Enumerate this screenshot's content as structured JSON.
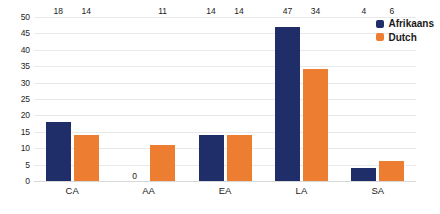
{
  "chart_data": {
    "type": "bar",
    "title": "",
    "subtitle": "",
    "xlabel": "",
    "ylabel": "",
    "categories": [
      "CA",
      "AA",
      "EA",
      "LA",
      "SA"
    ],
    "series": [
      {
        "name": "Afrikaans",
        "color": "#1F2D69",
        "values": [
          18,
          0,
          14,
          47,
          4
        ]
      },
      {
        "name": "Dutch",
        "color": "#ED7D31",
        "values": [
          14,
          11,
          14,
          34,
          6
        ]
      }
    ],
    "ylim": [
      0,
      50
    ],
    "ytick_step": 5,
    "yticks": [
      0,
      5,
      10,
      15,
      20,
      25,
      30,
      35,
      40,
      45,
      50
    ],
    "ytick_labels": [
      "0",
      "5",
      "10",
      "15",
      "20",
      "25",
      "30",
      "35",
      "40",
      "45",
      "50"
    ],
    "data_labels": [
      {
        "category": "CA",
        "series": "Afrikaans",
        "label": "18"
      },
      {
        "category": "CA",
        "series": "Dutch",
        "label": "14"
      },
      {
        "category": "AA",
        "series": "Afrikaans",
        "label": "0"
      },
      {
        "category": "AA",
        "series": "Dutch",
        "label": "11"
      },
      {
        "category": "EA",
        "series": "Afrikaans",
        "label": "14"
      },
      {
        "category": "EA",
        "series": "Dutch",
        "label": "14"
      },
      {
        "category": "LA",
        "series": "Afrikaans",
        "label": "47"
      },
      {
        "category": "LA",
        "series": "Dutch",
        "label": "34"
      },
      {
        "category": "SA",
        "series": "Afrikaans",
        "label": "4"
      },
      {
        "category": "SA",
        "series": "Dutch",
        "label": "6"
      }
    ],
    "grid": true,
    "grid_color": "#E9E9E9",
    "legend_position": "top-right",
    "background": "#FFFFFF"
  },
  "legend": {
    "items": [
      {
        "label": "Afrikaans",
        "color": "#1F2D69"
      },
      {
        "label": "Dutch",
        "color": "#ED7D31"
      }
    ]
  }
}
